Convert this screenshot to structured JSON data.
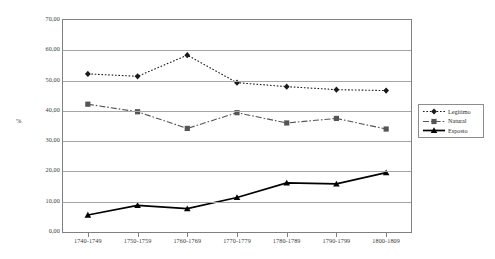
{
  "chart_data": {
    "type": "line",
    "title": "",
    "subtitle": "",
    "xlabel": "",
    "ylabel": "%",
    "ylim": [
      0,
      70
    ],
    "ytick_labels": [
      "0,00",
      "10,00",
      "20,00",
      "30,00",
      "40,00",
      "50,00",
      "60,00",
      "70,00"
    ],
    "ytick_values": [
      0,
      10,
      20,
      30,
      40,
      50,
      60,
      70
    ],
    "grid": true,
    "legend_position": "right",
    "categories": [
      "1740-1749",
      "1750-1759",
      "1760-1769",
      "1770-1779",
      "1780-1789",
      "1790-1799",
      "1800-1809"
    ],
    "series": [
      {
        "name": "Legitimo",
        "marker": "diamond",
        "line_style": "dotted",
        "color": "#1a1a1a",
        "values": [
          52.2,
          51.4,
          58.4,
          49.3,
          48.0,
          47.0,
          46.7
        ]
      },
      {
        "name": "Natural",
        "marker": "square",
        "line_style": "dash-dot",
        "color": "#555555",
        "values": [
          42.2,
          39.7,
          34.2,
          39.4,
          36.0,
          37.5,
          34.0
        ]
      },
      {
        "name": "Esposto",
        "marker": "triangle",
        "line_style": "solid",
        "color": "#000000",
        "values": [
          5.6,
          8.8,
          7.7,
          11.4,
          16.2,
          15.9,
          19.6
        ]
      }
    ]
  },
  "axis": {
    "y_title": "%"
  },
  "legend": {
    "items": [
      {
        "label": "Legitimo"
      },
      {
        "label": "Natural"
      },
      {
        "label": "Esposto"
      }
    ]
  }
}
